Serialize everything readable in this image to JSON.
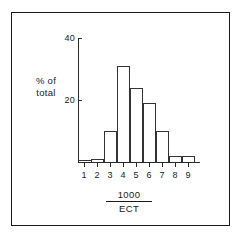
{
  "chart_data": {
    "type": "bar",
    "title": "",
    "subtitle": "",
    "xlabel_numerator": "1000",
    "xlabel_denominator": "ECT",
    "xlabel": "1000/ECT",
    "ylabel_line1": "% of",
    "ylabel_line2": "total",
    "ylabel": "% of total",
    "categories": [
      "1",
      "2",
      "3",
      "4",
      "5",
      "6",
      "7",
      "8",
      "9"
    ],
    "values": [
      0.5,
      1,
      10,
      31,
      24,
      19,
      10,
      2,
      2
    ],
    "ytick_labels": [
      "20",
      "40"
    ],
    "ytick_values": [
      20,
      40
    ],
    "ylim": [
      0,
      40
    ],
    "xlim": [
      0.5,
      9.5
    ],
    "grid": false,
    "legend": "none",
    "bar_style": "open-outline histogram",
    "colors": {
      "axis": "#2a2a2a",
      "bar_outline": "#333333",
      "frame": "#1a1a1a",
      "background": "#ffffff",
      "text": "#1a1a1a"
    }
  }
}
